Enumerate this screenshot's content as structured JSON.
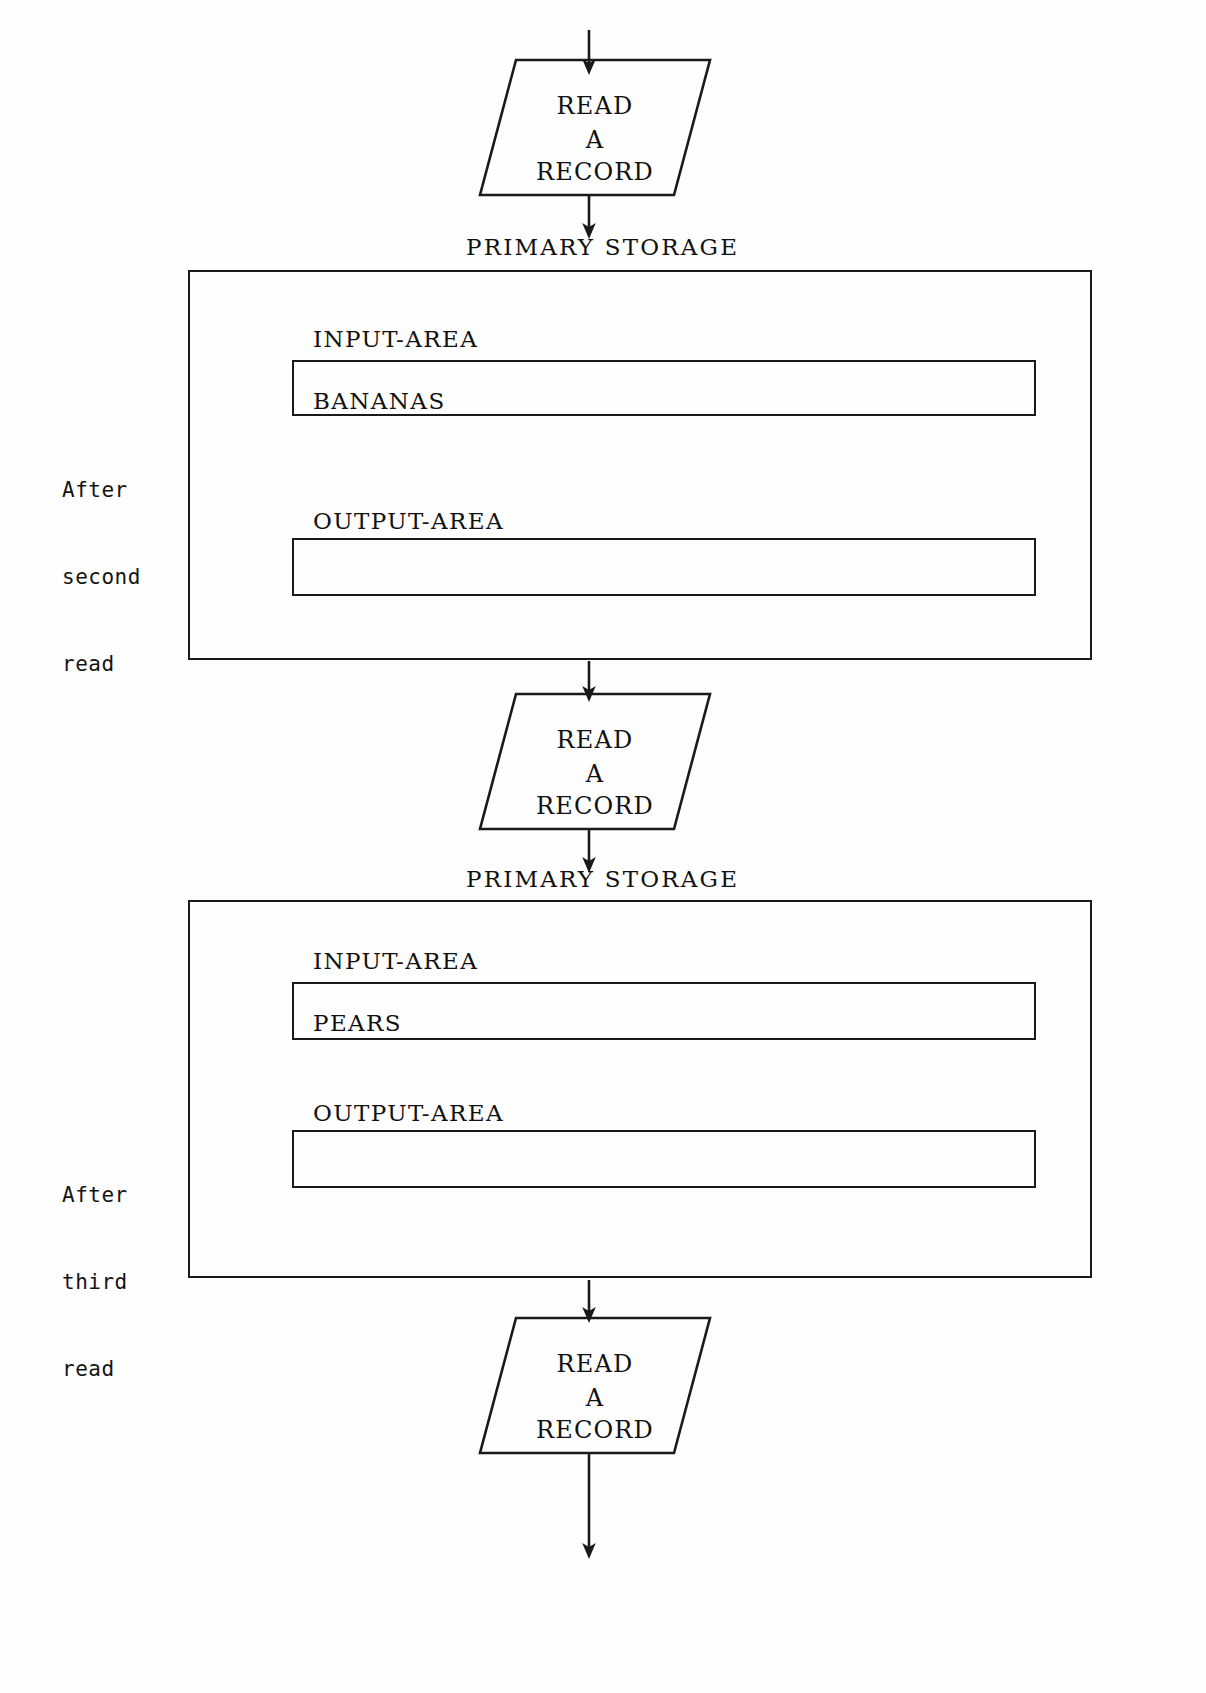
{
  "diagram": {
    "line_color": "#1a1a1a",
    "text_color": "#111111",
    "background": "#fefefe"
  },
  "labels": {
    "primary_storage": "PRIMARY STORAGE",
    "input_area": "INPUT-AREA",
    "output_area": "OUTPUT-AREA"
  },
  "io_symbols": [
    {
      "id": "read-1",
      "line1": "READ",
      "line2": "A",
      "line3": "RECORD"
    },
    {
      "id": "read-2",
      "line1": "READ",
      "line2": "A",
      "line3": "RECORD"
    },
    {
      "id": "read-3",
      "line1": "READ",
      "line2": "A",
      "line3": "RECORD"
    }
  ],
  "stages": [
    {
      "id": "after-second-read",
      "caption_line1": "After",
      "caption_line2": "second",
      "caption_line3": "read",
      "input_area_label": "INPUT-AREA",
      "input_area_value": "BANANAS",
      "output_area_label": "OUTPUT-AREA",
      "output_area_value": "",
      "storage_label": "PRIMARY STORAGE"
    },
    {
      "id": "after-third-read",
      "caption_line1": "After",
      "caption_line2": "third",
      "caption_line3": "read",
      "input_area_label": "INPUT-AREA",
      "input_area_value": "PEARS",
      "output_area_label": "OUTPUT-AREA",
      "output_area_value": "",
      "storage_label": "PRIMARY STORAGE"
    }
  ],
  "connectors": [
    {
      "id": "arrow-top-into-read-1",
      "direction": "down"
    },
    {
      "id": "arrow-read-1-to-storage-1",
      "direction": "down"
    },
    {
      "id": "arrow-storage-1-to-read-2",
      "direction": "down"
    },
    {
      "id": "arrow-read-2-to-storage-2",
      "direction": "down"
    },
    {
      "id": "arrow-storage-2-to-read-3",
      "direction": "down"
    },
    {
      "id": "arrow-read-3-out",
      "direction": "down"
    }
  ]
}
